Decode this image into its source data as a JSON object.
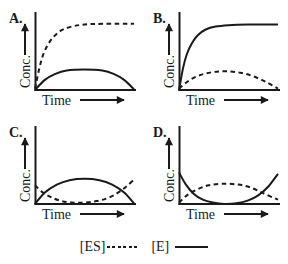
{
  "figure": {
    "background": "#ffffff",
    "ink": "#1a1a1a"
  },
  "chart_data": [
    {
      "type": "line",
      "panel_label": "A.",
      "xlabel": "Time",
      "ylabel": "Conc.",
      "axes": "qualitative sketch; arrows show increasing direction; no ticks or numeric scale",
      "x_units": "normalized 0-1",
      "y_units": "normalized 0-1 (fraction of axis height)",
      "series": [
        {
          "name": "[ES]",
          "style": "dashed",
          "shape": "rapid rise then high plateau",
          "points": [
            [
              0,
              0.02
            ],
            [
              0.04,
              0.28
            ],
            [
              0.08,
              0.48
            ],
            [
              0.13,
              0.63
            ],
            [
              0.19,
              0.74
            ],
            [
              0.27,
              0.83
            ],
            [
              0.37,
              0.88
            ],
            [
              0.5,
              0.91
            ],
            [
              0.7,
              0.92
            ],
            [
              1,
              0.92
            ]
          ]
        },
        {
          "name": "[E]",
          "style": "solid",
          "shape": "low broad hump returning to baseline",
          "points": [
            [
              0,
              0
            ],
            [
              0.1,
              0.14
            ],
            [
              0.2,
              0.22
            ],
            [
              0.32,
              0.27
            ],
            [
              0.5,
              0.285
            ],
            [
              0.68,
              0.27
            ],
            [
              0.8,
              0.22
            ],
            [
              0.9,
              0.14
            ],
            [
              1,
              0.01
            ]
          ]
        }
      ]
    },
    {
      "type": "line",
      "panel_label": "B.",
      "xlabel": "Time",
      "ylabel": "Conc.",
      "axes": "qualitative sketch; arrows show increasing direction; no ticks or numeric scale",
      "x_units": "normalized 0-1",
      "y_units": "normalized 0-1 (fraction of axis height)",
      "series": [
        {
          "name": "[ES]",
          "style": "dashed",
          "shape": "low broad hump returning to baseline",
          "points": [
            [
              0,
              0.02
            ],
            [
              0.1,
              0.13
            ],
            [
              0.22,
              0.21
            ],
            [
              0.35,
              0.25
            ],
            [
              0.48,
              0.26
            ],
            [
              0.62,
              0.24
            ],
            [
              0.75,
              0.19
            ],
            [
              0.88,
              0.11
            ],
            [
              1,
              0.02
            ]
          ]
        },
        {
          "name": "[E]",
          "style": "solid",
          "shape": "rapid rise then high plateau",
          "points": [
            [
              0,
              0
            ],
            [
              0.04,
              0.3
            ],
            [
              0.08,
              0.5
            ],
            [
              0.13,
              0.65
            ],
            [
              0.19,
              0.76
            ],
            [
              0.27,
              0.84
            ],
            [
              0.37,
              0.88
            ],
            [
              0.5,
              0.9
            ],
            [
              0.7,
              0.91
            ],
            [
              1,
              0.91
            ]
          ]
        }
      ]
    },
    {
      "type": "line",
      "panel_label": "C.",
      "xlabel": "Time",
      "ylabel": "Conc.",
      "axes": "qualitative sketch; arrows show increasing direction; no ticks or numeric scale",
      "x_units": "normalized 0-1",
      "y_units": "normalized 0-1 (fraction of axis height)",
      "series": [
        {
          "name": "[ES]",
          "style": "dashed",
          "shape": "starts moderate, dips to near zero mid-curve, rises again at end",
          "points": [
            [
              0,
              0.26
            ],
            [
              0.08,
              0.16
            ],
            [
              0.17,
              0.09
            ],
            [
              0.27,
              0.04
            ],
            [
              0.38,
              0.02
            ],
            [
              0.5,
              0.02
            ],
            [
              0.62,
              0.04
            ],
            [
              0.73,
              0.08
            ],
            [
              0.83,
              0.15
            ],
            [
              0.92,
              0.24
            ],
            [
              1,
              0.34
            ]
          ]
        },
        {
          "name": "[E]",
          "style": "solid",
          "shape": "broad hump spanning full axis, returning to baseline",
          "points": [
            [
              0,
              0
            ],
            [
              0.1,
              0.16
            ],
            [
              0.22,
              0.27
            ],
            [
              0.35,
              0.33
            ],
            [
              0.5,
              0.35
            ],
            [
              0.65,
              0.33
            ],
            [
              0.78,
              0.27
            ],
            [
              0.9,
              0.16
            ],
            [
              1,
              0.01
            ]
          ]
        }
      ]
    },
    {
      "type": "line",
      "panel_label": "D.",
      "xlabel": "Time",
      "ylabel": "Conc.",
      "axes": "qualitative sketch; arrows show increasing direction; no ticks or numeric scale",
      "x_units": "normalized 0-1",
      "y_units": "normalized 0-1 (fraction of axis height)",
      "series": [
        {
          "name": "[ES]",
          "style": "dashed",
          "shape": "broad hump, falling near baseline at end",
          "points": [
            [
              0,
              0.02
            ],
            [
              0.08,
              0.12
            ],
            [
              0.18,
              0.2
            ],
            [
              0.3,
              0.26
            ],
            [
              0.45,
              0.28
            ],
            [
              0.6,
              0.27
            ],
            [
              0.72,
              0.23
            ],
            [
              0.85,
              0.15
            ],
            [
              1,
              0.06
            ]
          ]
        },
        {
          "name": "[E]",
          "style": "solid",
          "shape": "starts high, dips to flat zero mid-curve, rises again at end (U shape)",
          "points": [
            [
              0,
              0.44
            ],
            [
              0.07,
              0.27
            ],
            [
              0.15,
              0.14
            ],
            [
              0.24,
              0.06
            ],
            [
              0.34,
              0.02
            ],
            [
              0.46,
              0
            ],
            [
              0.58,
              0.01
            ],
            [
              0.7,
              0.05
            ],
            [
              0.8,
              0.12
            ],
            [
              0.9,
              0.24
            ],
            [
              1,
              0.42
            ]
          ]
        }
      ]
    }
  ],
  "legend": {
    "items": [
      {
        "label": "[ES]",
        "style": "dashed"
      },
      {
        "label": "[E]",
        "style": "solid"
      }
    ]
  }
}
